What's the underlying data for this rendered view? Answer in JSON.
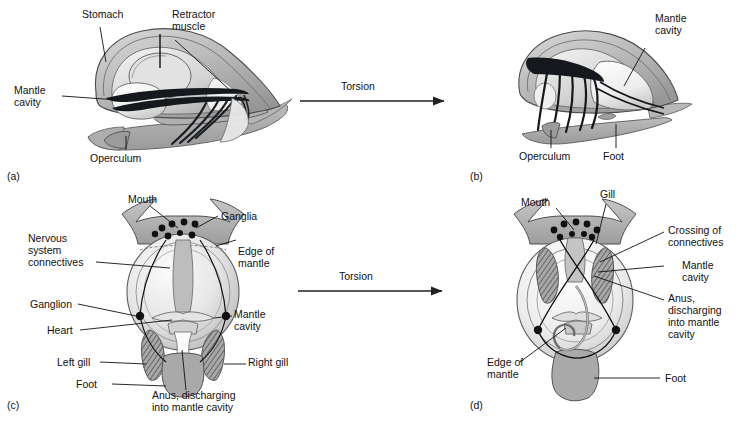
{
  "figure": {
    "background": "#ffffff",
    "ink": "#111111",
    "process_label": "Torsion"
  },
  "panels": [
    {
      "id": "a",
      "letter": "(a)",
      "view": "lateral, pre-torsion",
      "labels": [
        {
          "name": "stomach",
          "text": "Stomach"
        },
        {
          "name": "retractor-muscle",
          "text": "Retractor\nmuscle"
        },
        {
          "name": "mantle-cavity",
          "text": "Mantle\ncavity"
        },
        {
          "name": "operculum",
          "text": "Operculum"
        }
      ]
    },
    {
      "id": "b",
      "letter": "(b)",
      "view": "lateral, post-torsion",
      "labels": [
        {
          "name": "mantle-cavity",
          "text": "Mantle\ncavity"
        },
        {
          "name": "operculum",
          "text": "Operculum"
        },
        {
          "name": "foot",
          "text": "Foot"
        }
      ]
    },
    {
      "id": "c",
      "letter": "(c)",
      "view": "dorsal, pre-torsion",
      "labels": [
        {
          "name": "mouth",
          "text": "Mouth"
        },
        {
          "name": "ganglia",
          "text": "Ganglia"
        },
        {
          "name": "edge-of-mantle",
          "text": "Edge of\nmantle"
        },
        {
          "name": "nervous-system-connectives",
          "text": "Nervous\nsystem\nconnectives"
        },
        {
          "name": "ganglion",
          "text": "Ganglion"
        },
        {
          "name": "heart",
          "text": "Heart"
        },
        {
          "name": "mantle-cavity",
          "text": "Mantle\ncavity"
        },
        {
          "name": "left-gill",
          "text": "Left gill"
        },
        {
          "name": "right-gill",
          "text": "Right gill"
        },
        {
          "name": "foot",
          "text": "Foot"
        },
        {
          "name": "anus",
          "text": "Anus, discharging\ninto mantle cavity"
        }
      ]
    },
    {
      "id": "d",
      "letter": "(d)",
      "view": "dorsal, post-torsion",
      "labels": [
        {
          "name": "mouth",
          "text": "Mouth"
        },
        {
          "name": "gill",
          "text": "Gill"
        },
        {
          "name": "crossing-of-connectives",
          "text": "Crossing of\nconnectives"
        },
        {
          "name": "mantle-cavity",
          "text": "Mantle\ncavity"
        },
        {
          "name": "anus",
          "text": "Anus,\ndischarging\ninto mantle\ncavity"
        },
        {
          "name": "edge-of-mantle",
          "text": "Edge of\nmantle"
        },
        {
          "name": "foot",
          "text": "Foot"
        }
      ]
    }
  ],
  "arrows": [
    {
      "name": "torsion-arrow-top",
      "label": "Torsion"
    },
    {
      "name": "torsion-arrow-bottom",
      "label": "Torsion"
    }
  ]
}
